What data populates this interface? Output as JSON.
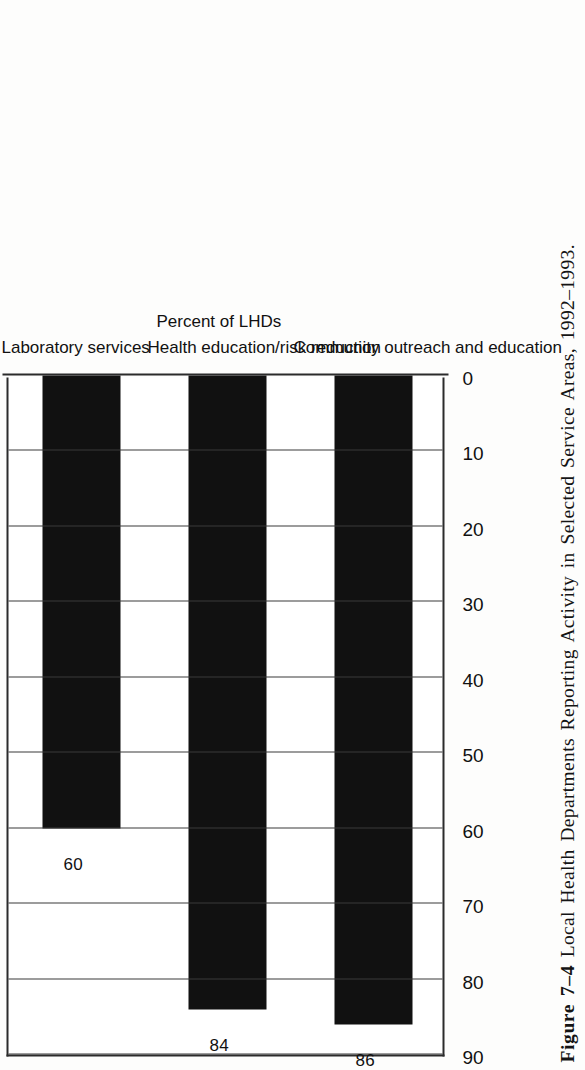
{
  "figure": {
    "number_label": "Figure 7–4",
    "caption_text": "Local Health Departments Reporting Activity in Selected Service Areas, 1992–1993."
  },
  "chart_data": {
    "type": "bar",
    "title": "",
    "subtitle": "",
    "xlabel": "",
    "ylabel": "Percent of LHDs",
    "categories": [
      "Laboratory services",
      "Health education/risk reduction",
      "Community outreach and education"
    ],
    "values": [
      60,
      84,
      86
    ],
    "data_labels": [
      "60",
      "84",
      "86"
    ],
    "ylim": [
      0,
      90
    ],
    "y_ticks": [
      0,
      10,
      20,
      30,
      40,
      50,
      60,
      70,
      80,
      90
    ],
    "y_tick_labels": [
      "0",
      "10",
      "20",
      "30",
      "40",
      "50",
      "60",
      "70",
      "80",
      "90"
    ],
    "grid": true,
    "grid_axis": "value",
    "legend": false,
    "legend_position": "none",
    "orientation": "vertical-rotated",
    "bar_color": "#111111",
    "frame_color": "#2b2b2b",
    "page_background": "#fdfdfc"
  }
}
